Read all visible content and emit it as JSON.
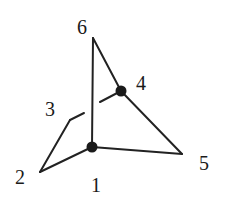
{
  "diagram": {
    "type": "knot-graph",
    "nodes": [
      {
        "id": "1",
        "label": "1",
        "x": 92,
        "y": 147,
        "dot": true,
        "lx": 97,
        "ly": 190
      },
      {
        "id": "2",
        "label": "2",
        "x": 40,
        "y": 172,
        "dot": false,
        "lx": 22,
        "ly": 182
      },
      {
        "id": "3",
        "label": "3",
        "x": 70,
        "y": 120,
        "dot": false,
        "lx": 51,
        "ly": 114
      },
      {
        "id": "4",
        "label": "4",
        "x": 121,
        "y": 91,
        "dot": true,
        "lx": 143,
        "ly": 88
      },
      {
        "id": "5",
        "label": "5",
        "x": 182,
        "y": 154,
        "dot": false,
        "lx": 206,
        "ly": 168
      },
      {
        "id": "6",
        "label": "6",
        "x": 93,
        "y": 38,
        "dot": false,
        "lx": 84,
        "ly": 33
      }
    ],
    "edges": [
      {
        "from": "6",
        "to": "1"
      },
      {
        "from": "6",
        "to": "4"
      },
      {
        "from": "4",
        "to": "5"
      },
      {
        "from": "5",
        "to": "1"
      },
      {
        "from": "1",
        "to": "2"
      },
      {
        "from": "2",
        "to": "3"
      },
      {
        "from": "3",
        "to": "4",
        "crossing_under": "6-1"
      }
    ],
    "colors": {
      "stroke": "#222222",
      "dot": "#1a1a1a",
      "background": "#ffffff"
    }
  },
  "labels": {
    "n1": "1",
    "n2": "2",
    "n3": "3",
    "n4": "4",
    "n5": "5",
    "n6": "6"
  }
}
